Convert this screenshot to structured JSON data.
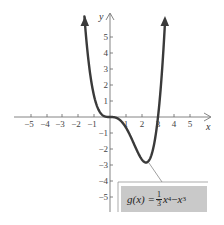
{
  "chart_data": {
    "type": "line",
    "title": "",
    "function_label": "g(x) = (1/3)x^4 - x^3",
    "xlabel": "x",
    "ylabel": "y",
    "xlim": [
      -6,
      6
    ],
    "ylim": [
      -6,
      6
    ],
    "x_ticks": [
      -5,
      -4,
      -3,
      -2,
      -1,
      1,
      2,
      3,
      4,
      5
    ],
    "y_ticks": [
      -5,
      -4,
      -3,
      -2,
      -1,
      1,
      2,
      3,
      4,
      5
    ],
    "grid": false,
    "series": [
      {
        "name": "g(x)",
        "x": [
          -1.6,
          -1.4,
          -1.2,
          -1.0,
          -0.8,
          -0.6,
          -0.4,
          -0.2,
          0,
          0.4,
          0.8,
          1.2,
          1.6,
          2.0,
          2.25,
          2.5,
          2.8,
          3.0,
          3.2,
          3.44
        ],
        "values": [
          6.28,
          4.02,
          2.42,
          1.33,
          0.65,
          0.26,
          0.07,
          0.01,
          0,
          -0.06,
          -0.38,
          -1.04,
          -1.91,
          -2.67,
          -2.85,
          -2.6,
          -1.87,
          0,
          1.17,
          6.0
        ],
        "color": "#3a3a3a"
      }
    ],
    "annotations": [
      {
        "text": "g(x) = 1/3 x^4 - x^3",
        "points_to": [
          2.25,
          -2.85
        ]
      }
    ]
  },
  "labels": {
    "x_axis": "x",
    "y_axis": "y",
    "x_ticks": [
      "−5",
      "−4",
      "−3",
      "−2",
      "−1",
      "1",
      "2",
      "3",
      "4",
      "5"
    ],
    "y_ticks": [
      "5",
      "4",
      "3",
      "2",
      "1",
      "−1",
      "−2",
      "−3",
      "−4",
      "−5"
    ],
    "formula": {
      "lhs": "g(x) = ",
      "frac_num": "1",
      "frac_den": "3",
      "term1": "x",
      "exp1": "4",
      "minus": " − ",
      "term2": "x",
      "exp2": "3"
    }
  }
}
